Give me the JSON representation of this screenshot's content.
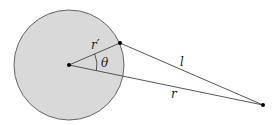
{
  "diagram": {
    "labels": {
      "r_prime": "r′",
      "theta": "θ",
      "l": "l",
      "r": "r"
    },
    "colors": {
      "disk_fill": "#d9d9d9",
      "stroke": "#555555",
      "point": "#000000"
    }
  }
}
